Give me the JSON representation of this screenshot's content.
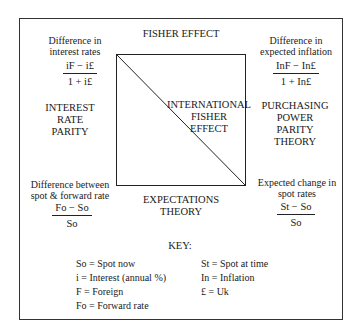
{
  "diagram": {
    "top_label": "FISHER EFFECT",
    "center_label": [
      "INTERNATIONAL",
      "FISHER",
      "EFFECT"
    ],
    "bottom_label": [
      "EXPECTATIONS",
      "THEORY"
    ],
    "left_label": [
      "INTEREST",
      "RATE",
      "PARITY"
    ],
    "right_label": [
      "PURCHASING",
      "POWER",
      "PARITY",
      "THEORY"
    ],
    "corners": {
      "top_left": {
        "caption": [
          "Difference in",
          "interest rates"
        ],
        "numerator": "iF − i£",
        "denominator": "1 + i£"
      },
      "top_right": {
        "caption": [
          "Difference in",
          "expected inflation"
        ],
        "numerator": "InF − In£",
        "denominator": "1 + In£"
      },
      "bottom_left": {
        "caption": [
          "Difference between",
          "spot & forward rate"
        ],
        "numerator": "Fo − So",
        "denominator": "So"
      },
      "bottom_right": {
        "caption": [
          "Expected change in",
          "spot rates"
        ],
        "numerator": "St − So",
        "denominator": "So"
      }
    },
    "key": {
      "title": "KEY:",
      "left": [
        "So = Spot now",
        "i   = Interest (annual %)",
        "F  = Foreign",
        "Fo = Forward rate"
      ],
      "right": [
        "St = Spot at time",
        "In = Inflation",
        "£  = Uk"
      ]
    }
  }
}
